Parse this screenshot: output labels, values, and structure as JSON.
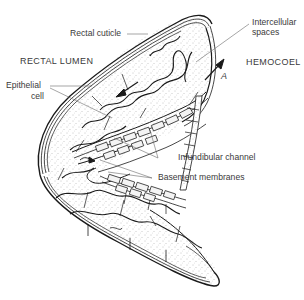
{
  "diagram": {
    "regions": {
      "lumen": "RECTAL LUMEN",
      "hemocoel": "HEMOCOEL"
    },
    "labels": {
      "rectal_cuticle": "Rectal cuticle",
      "intercellular_line1": "Intercellular",
      "intercellular_line2": "spaces",
      "epithelial_line1": "Epithelial",
      "epithelial_line2": "cell",
      "point_a": "A",
      "infundibular_channel": "Infundibular channel",
      "basement_membranes": "Basement membranes"
    },
    "colors": {
      "ink": "#1a1a1a",
      "label_text": "#3a3a3a",
      "leader_line": "#6a6a6a",
      "stipple": "#8a8a8a",
      "background": "#ffffff"
    }
  }
}
